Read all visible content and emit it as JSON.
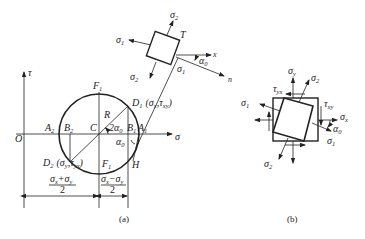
{
  "figure_a": {
    "caption": "(a)",
    "axes": {
      "tau_label": "τ",
      "sigma_label": "σ",
      "origin_label": "O"
    },
    "circle_points": {
      "F1_top": "F",
      "F1_top_sub": "1",
      "F1_bottom": "F",
      "F1_bottom_sub": "1",
      "C": "C",
      "R": "R",
      "A1": "A",
      "A1_sub": "1",
      "A2": "A",
      "A2_sub": "2",
      "B1": "B",
      "B1_sub": "1",
      "B2": "B",
      "B2_sub": "2",
      "D1": "D",
      "D1_sub": "1",
      "D2": "D",
      "D2_sub": "2",
      "H": "H"
    },
    "D1_coords": {
      "open": "(",
      "sigma": "σ",
      "sigma_sub": "x",
      "sep": ",",
      "tau": "τ",
      "tau_sub": "xy",
      "close": ")"
    },
    "D2_coords": {
      "open": "(",
      "sigma": "σ",
      "sigma_sub": "y",
      "sep": ",",
      "tau": "τ",
      "tau_sub": "yx",
      "close": ")"
    },
    "angle_2a0": {
      "prefix": "2α",
      "sub": "0"
    },
    "angle_a0": {
      "prefix": "α",
      "sub": "0"
    },
    "dim_left": {
      "numerator": "σx+σy",
      "num_a": "σ",
      "num_a_sub": "x",
      "num_op": "+",
      "num_b": "σ",
      "num_b_sub": "y",
      "denominator": "2"
    },
    "dim_right": {
      "numerator": "σx−σy",
      "num_a": "σ",
      "num_a_sub": "x",
      "num_op": "−",
      "num_b": "σ",
      "num_b_sub": "y",
      "denominator": "2"
    },
    "element": {
      "label_T": "T",
      "sigma1_left": "σ",
      "sigma1_left_sub": "1",
      "sigma2_top": "σ",
      "sigma2_top_sub": "2",
      "sigma2_bottom": "σ",
      "sigma2_bottom_sub": "2",
      "sigma1_right": "σ",
      "sigma1_right_sub": "1",
      "x_axis": "x",
      "n_axis": "n",
      "alpha": "α",
      "alpha_sub": "0"
    }
  },
  "figure_b": {
    "caption": "(b)",
    "labels": {
      "sigma_y": "σ",
      "sigma_y_sub": "y",
      "sigma_2_top": "σ",
      "sigma_2_top_sub": "2",
      "tau_yx": "τ",
      "tau_yx_sub": "yx",
      "tau_xy": "τ",
      "tau_xy_sub": "xy",
      "sigma_1_left": "σ",
      "sigma_1_left_sub": "1",
      "sigma_x": "σ",
      "sigma_x_sub": "x",
      "alpha": "α",
      "alpha_sub": "0",
      "sigma_1_right": "σ",
      "sigma_1_right_sub": "1",
      "sigma_2_bottom": "σ",
      "sigma_2_bottom_sub": "2"
    }
  }
}
